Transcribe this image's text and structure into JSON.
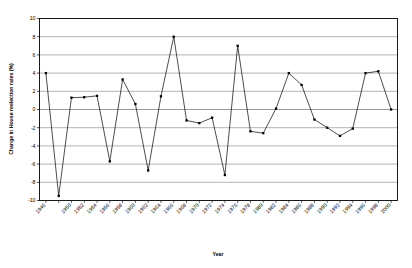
{
  "chart_data": {
    "type": "line",
    "title": "",
    "xlabel": "Year",
    "ylabel": "Change in House reelection rates (%)",
    "ylim": [
      -10,
      10
    ],
    "ytick_step": 2,
    "yticks": [
      10,
      8,
      6,
      4,
      2,
      0,
      -2,
      -4,
      -6,
      -8,
      -10
    ],
    "grid": true,
    "legend": "none",
    "marker": "square",
    "line_color": "#000000",
    "grid_color": "#808080",
    "axis_color": "#000000",
    "categories": [
      "1946",
      "1948",
      "1950",
      "1952",
      "1954",
      "1956",
      "1958",
      "1960",
      "1962",
      "1964",
      "1966",
      "1968",
      "1970",
      "1972",
      "1974",
      "1976",
      "1978",
      "1980",
      "1982",
      "1984",
      "1986",
      "1988",
      "1990",
      "1992",
      "1994",
      "1996",
      "1998",
      "2000"
    ],
    "xtick_labels": [
      "1946",
      "1950",
      "1952",
      "1954",
      "1956",
      "1958",
      "1960",
      "1962",
      "1964",
      "1966",
      "1968",
      "1970",
      "1972",
      "1974",
      "1976",
      "1978",
      "1980",
      "1982",
      "1984",
      "1986",
      "1988",
      "1990",
      "1992",
      "1994",
      "1996",
      "1998",
      "2000"
    ],
    "values": [
      4.0,
      -9.5,
      1.3,
      1.35,
      1.5,
      -5.7,
      3.3,
      0.6,
      -6.7,
      1.45,
      8.0,
      -1.2,
      -1.5,
      -0.9,
      -7.2,
      7.0,
      -2.4,
      -2.6,
      0.1,
      4.0,
      2.7,
      -1.1,
      -2.0,
      -2.9,
      -2.1,
      4.0,
      4.2,
      0.0
    ]
  }
}
